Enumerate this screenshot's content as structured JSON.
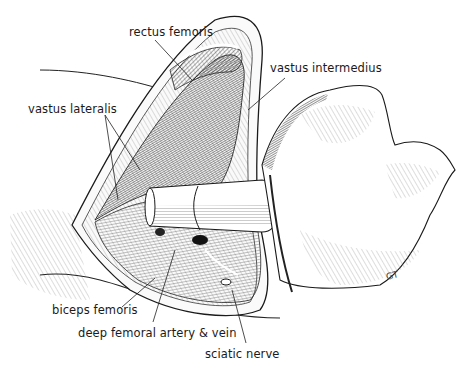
{
  "figure": {
    "type": "anatomical-illustration",
    "labels": [
      {
        "id": "rectus-femoris",
        "text": "rectus femoris",
        "x": 129,
        "y": 27
      },
      {
        "id": "vastus-intermedius",
        "text": "vastus intermedius",
        "x": 270,
        "y": 63
      },
      {
        "id": "vastus-lateralis",
        "text": "vastus lateralis",
        "x": 28,
        "y": 104
      },
      {
        "id": "biceps-femoris",
        "text": "biceps femoris",
        "x": 52,
        "y": 305
      },
      {
        "id": "deep-femoral-artery-vein",
        "text": "deep femoral artery & vein",
        "x": 78,
        "y": 328
      },
      {
        "id": "sciatic-nerve",
        "text": "sciatic nerve",
        "x": 205,
        "y": 349
      }
    ],
    "signature": "GT",
    "colors": {
      "ink": "#1a1a1a",
      "background": "#ffffff"
    }
  }
}
